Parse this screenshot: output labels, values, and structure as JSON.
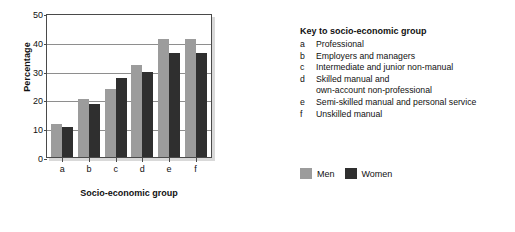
{
  "chart_data": {
    "type": "bar",
    "title": "",
    "xlabel": "Socio-economic group",
    "ylabel": "Percentage",
    "categories": [
      "a",
      "b",
      "c",
      "d",
      "e",
      "f"
    ],
    "series": [
      {
        "name": "Men",
        "color": "#9c9c9c",
        "values": [
          11.5,
          20,
          23.5,
          32,
          41,
          41
        ]
      },
      {
        "name": "Women",
        "color": "#2f2f2f",
        "values": [
          10.5,
          18.5,
          27.5,
          29.5,
          36,
          36
        ]
      }
    ],
    "ylim": [
      0,
      50
    ],
    "yticks": [
      0,
      10,
      20,
      30,
      40,
      50
    ],
    "ytick_labels": [
      "0",
      "10",
      "20",
      "30",
      "40",
      "50"
    ],
    "grid": true,
    "legend_position": "right-bottom"
  },
  "key": {
    "title": "Key to socio-economic group",
    "entries": [
      {
        "code": "a",
        "desc": "Professional",
        "desc2": ""
      },
      {
        "code": "b",
        "desc": "Employers and managers",
        "desc2": ""
      },
      {
        "code": "c",
        "desc": "Intermediate and junior non-manual",
        "desc2": ""
      },
      {
        "code": "d",
        "desc": "Skilled manual and",
        "desc2": "own-account non-professional"
      },
      {
        "code": "e",
        "desc": "Semi-skilled manual and personal service",
        "desc2": ""
      },
      {
        "code": "f",
        "desc": "Unskilled manual",
        "desc2": ""
      }
    ]
  },
  "legend": {
    "men_label": "Men",
    "women_label": "Women"
  },
  "colors": {
    "men": "#9c9c9c",
    "women": "#2f2f2f",
    "axis": "#4a4a4a",
    "grid": "#8e8e8e",
    "background": "#ffffff"
  }
}
